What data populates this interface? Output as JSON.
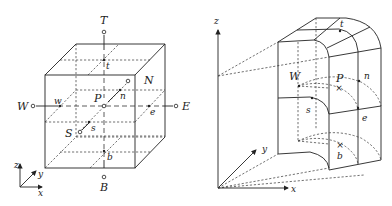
{
  "figure": {
    "left_panel": {
      "description": "Cartesian control volume cube around node P",
      "node_labels": {
        "top": "T",
        "bottom": "B",
        "west": "W",
        "east": "E",
        "north": "N",
        "south": "S",
        "center": "P"
      },
      "face_labels": {
        "top": "t",
        "bottom": "b",
        "west": "w",
        "east": "e",
        "north": "n",
        "south": "s"
      },
      "axes": {
        "x": "x",
        "y": "y",
        "z": "z"
      }
    },
    "right_panel": {
      "description": "Curvilinear control volume with grid cells",
      "labels": {
        "west": "W",
        "center": "P",
        "top": "t",
        "north": "n",
        "south": "s",
        "east": "e",
        "bottom": "b"
      },
      "axes": {
        "x": "x",
        "y": "y",
        "z": "z"
      }
    }
  }
}
